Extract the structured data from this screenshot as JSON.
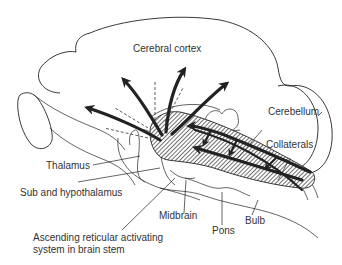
{
  "figure": {
    "type": "brain-sagittal-schematic",
    "colors": {
      "line": "#222222",
      "text": "#333333",
      "background": "#ffffff"
    }
  },
  "labels": {
    "cerebral_cortex": "Cerebral cortex",
    "cerebellum": "Cerebellum",
    "collaterals": "Collaterals",
    "thalamus": "Thalamus",
    "sub_hypothalamus": "Sub and hypothalamus",
    "midbrain": "Midbrain",
    "pons": "Pons",
    "bulb": "Bulb",
    "aras_line1": "Ascending reticular activating",
    "aras_line2": "system in brain stem"
  }
}
